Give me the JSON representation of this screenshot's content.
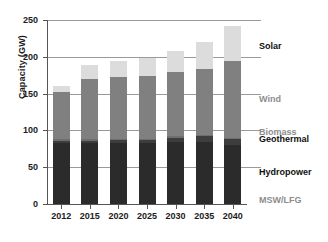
{
  "chart_data": {
    "type": "bar",
    "stacked": true,
    "title": "",
    "xlabel": "",
    "ylabel": "Capacity (GW)",
    "ylim": [
      0,
      250
    ],
    "yticks": [
      0,
      50,
      100,
      150,
      200,
      250
    ],
    "ytick_labels": [
      "0",
      "50",
      "100",
      "150",
      "200",
      "250"
    ],
    "grid": true,
    "legend_position": "right-inline",
    "categories": [
      "2012",
      "2015",
      "2020",
      "2025",
      "2030",
      "2035",
      "2040"
    ],
    "series": [
      {
        "name": "MSW/LFG",
        "color": "#2b2b2b",
        "label_style": "muted",
        "values": [
          4,
          4,
          4,
          4,
          4,
          4,
          4
        ]
      },
      {
        "name": "Hydropower",
        "color": "#2b2b2b",
        "label_style": "dark",
        "values": [
          79,
          79,
          79,
          79,
          80,
          80,
          76
        ]
      },
      {
        "name": "Geothermal",
        "color": "#3d3d3d",
        "label_style": "dark",
        "values": [
          3,
          3,
          4,
          4,
          6,
          8,
          8
        ]
      },
      {
        "name": "Biomass",
        "color": "#6e6e6e",
        "label_style": "muted",
        "values": [
          2,
          2,
          2,
          2,
          2,
          2,
          2
        ]
      },
      {
        "name": "Wind",
        "color": "#808080",
        "label_style": "muted",
        "values": [
          64,
          82,
          84,
          85,
          88,
          90,
          104
        ]
      },
      {
        "name": "Solar",
        "color": "#dcdcdc",
        "label_style": "dark",
        "values": [
          9,
          19,
          22,
          25,
          28,
          36,
          48
        ]
      }
    ],
    "totals": [
      161,
      189,
      195,
      199,
      208,
      220,
      242
    ],
    "annotations": [
      {
        "text": "Solar",
        "style": "dark",
        "value_position": 215
      },
      {
        "text": "Wind",
        "style": "muted",
        "value_position": 143
      },
      {
        "text": "Biomass",
        "style": "muted",
        "value_position": 98
      },
      {
        "text": "Geothermal",
        "style": "dark",
        "value_position": 88
      },
      {
        "text": "Hydropower",
        "style": "dark",
        "value_position": 44
      },
      {
        "text": "MSW/LFG",
        "style": "muted",
        "value_position": 6
      }
    ]
  }
}
